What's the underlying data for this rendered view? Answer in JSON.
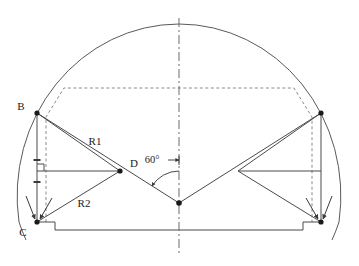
{
  "drawing": {
    "type": "engineering-section-diagram",
    "background_color": "#ffffff",
    "line_color": "#4a4a4a",
    "dark_line_color": "#333333",
    "text_color": "#1a1a1a",
    "labels": {
      "point_b": "B",
      "point_c": "C",
      "point_d": "D",
      "radius_1": "R1",
      "radius_2": "R2",
      "angle": "60°"
    },
    "geometry": {
      "centerline_x": 179,
      "arc": {
        "center_x": 179,
        "center_y": 196,
        "radius_x": 162,
        "radius_y": 172,
        "note": "large outer dome arc"
      },
      "point_b": {
        "x": 37,
        "y": 113
      },
      "point_c": {
        "x": 37,
        "y": 222
      },
      "point_d": {
        "x": 120,
        "y": 171
      },
      "point_b_right": {
        "x": 321,
        "y": 113
      },
      "point_c_right": {
        "x": 321,
        "y": 222
      },
      "vertex_center": {
        "x": 179,
        "y": 203
      },
      "baseline_y": 230,
      "notch": {
        "left_inner_x": 55,
        "right_inner_x": 303,
        "step_y": 222
      },
      "dashed_polygon": [
        {
          "x": 46,
          "y": 117
        },
        {
          "x": 64,
          "y": 88
        },
        {
          "x": 294,
          "y": 88
        },
        {
          "x": 312,
          "y": 117
        },
        {
          "x": 312,
          "y": 222
        }
      ],
      "right_angle_marker": {
        "x": 37,
        "y": 171
      },
      "tick_marks_y": [
        160,
        182
      ]
    }
  }
}
